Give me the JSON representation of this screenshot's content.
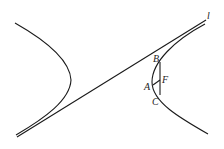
{
  "diagram": {
    "type": "hyperbola-with-tangent",
    "labels": {
      "line": "l",
      "B": "B",
      "A": "A",
      "F": "F",
      "C": "C"
    },
    "stroke_color": "#1a1a1a",
    "background": "#ffffff"
  }
}
